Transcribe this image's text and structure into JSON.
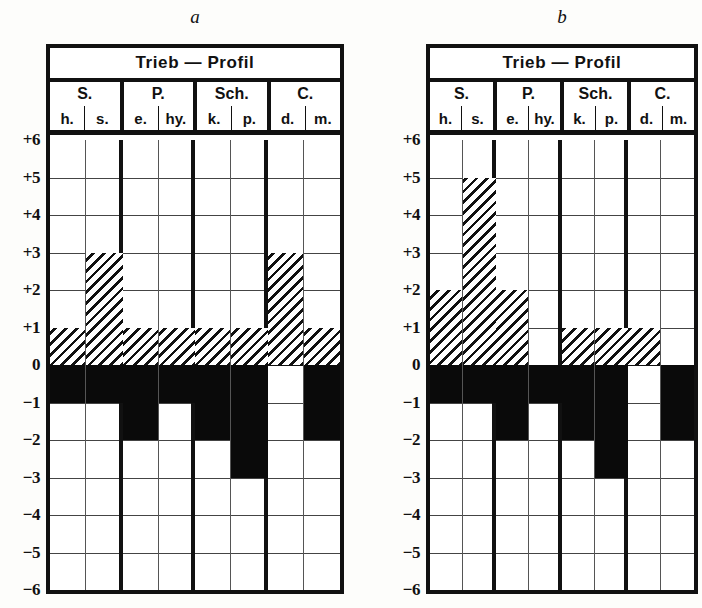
{
  "figure": {
    "panel_labels": [
      "a",
      "b"
    ],
    "title": "Trieb — Profil",
    "y_axis_labels": [
      "+6",
      "+5",
      "+4",
      "+3",
      "+2",
      "+1",
      "0",
      "−1",
      "−2",
      "−3",
      "−4",
      "−5",
      "−6"
    ],
    "vectors": [
      {
        "name": "S.",
        "factors": [
          "h.",
          "s."
        ]
      },
      {
        "name": "P.",
        "factors": [
          "e.",
          "hy."
        ]
      },
      {
        "name": "Sch.",
        "factors": [
          "k.",
          "p."
        ]
      },
      {
        "name": "C.",
        "factors": [
          "d.",
          "m."
        ]
      }
    ],
    "colors": {
      "ink": "#111111",
      "paper": "#ffffff",
      "negative_fill": "#0a0a0a"
    }
  },
  "chart_data": {
    "type": "bar",
    "title": "Trieb — Profil",
    "xlabel": "",
    "ylabel": "",
    "ylim": [
      -6,
      6
    ],
    "grid": true,
    "legend": "none",
    "categories": [
      "h.",
      "s.",
      "e.",
      "hy.",
      "k.",
      "p.",
      "d.",
      "m."
    ],
    "vector_groups": [
      "S.",
      "S.",
      "P.",
      "P.",
      "Sch.",
      "Sch.",
      "C.",
      "C."
    ],
    "panels": [
      {
        "label": "a",
        "positive": [
          1,
          3,
          1,
          1,
          1,
          1,
          3,
          1
        ],
        "negative": [
          -1,
          -1,
          -2,
          -1,
          -2,
          -3,
          0,
          -2
        ]
      },
      {
        "label": "b",
        "positive": [
          2,
          5,
          2,
          0,
          1,
          1,
          1,
          0
        ],
        "negative": [
          -1,
          -1,
          -2,
          -1,
          -2,
          -3,
          0,
          -2
        ]
      }
    ]
  }
}
